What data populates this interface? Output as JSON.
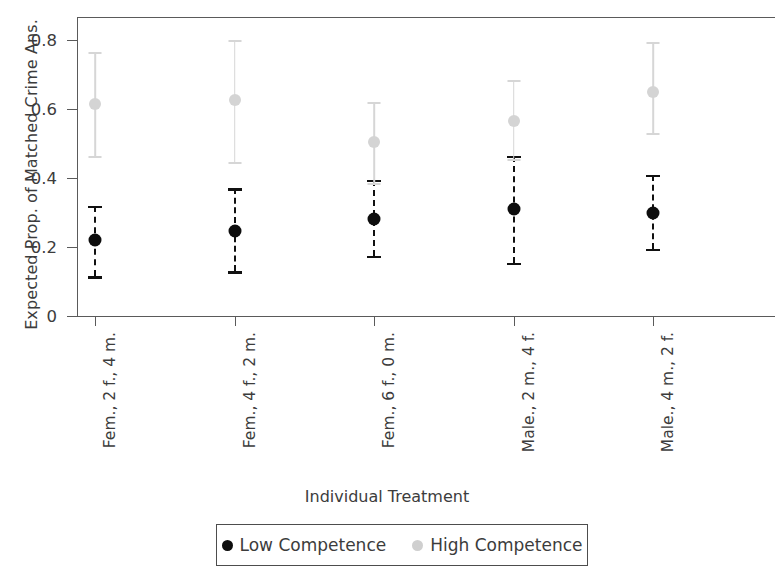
{
  "chart_data": {
    "type": "scatter",
    "title": "",
    "xlabel": "Individual Treatment",
    "ylabel": "Expected Prop. of Matched Crime Ans.",
    "ylim": [
      0,
      0.86
    ],
    "yticks": [
      0,
      0.2,
      0.4,
      0.6,
      0.8
    ],
    "ytick_labels": [
      "0",
      "0.2",
      "0.4",
      "0.6",
      "0.8"
    ],
    "grid": false,
    "legend_position": "bottom",
    "categories": [
      "Fem., 2 f., 4 m.",
      "Fem., 4 f., 2 m.",
      "Fem., 6 f., 0 m.",
      "Male., 2 m., 4 f.",
      "Male., 4 m., 2 f.",
      "Male., 6 m., 0 f."
    ],
    "series": [
      {
        "name": "Low Competence",
        "color": "#0d0d0d",
        "marker": "circle",
        "errorbar_style": "dashed",
        "values": [
          0.22,
          0.245,
          0.28,
          0.31,
          0.3,
          0.21
        ],
        "ci_low": [
          0.115,
          0.13,
          0.175,
          0.155,
          0.195,
          0.145
        ],
        "ci_high": [
          0.32,
          0.37,
          0.395,
          0.465,
          0.41,
          0.275
        ]
      },
      {
        "name": "High Competence",
        "color": "#d4d4d4",
        "marker": "circle",
        "errorbar_style": "solid",
        "values": [
          0.615,
          0.625,
          0.505,
          0.565,
          0.65,
          0.6
        ],
        "ci_low": [
          0.465,
          0.445,
          0.385,
          0.455,
          0.53,
          0.51
        ],
        "ci_high": [
          0.765,
          0.8,
          0.62,
          0.685,
          0.795,
          0.695
        ]
      }
    ]
  },
  "legend": {
    "items": [
      {
        "label": "Low Competence",
        "color": "#0d0d0d"
      },
      {
        "label": "High Competence",
        "color": "#cfcfcf"
      }
    ]
  }
}
